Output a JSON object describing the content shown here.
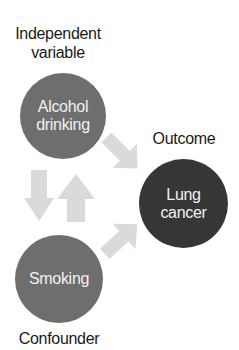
{
  "diagram": {
    "type": "causal-diagram",
    "labels": {
      "independent_line1": "Independent",
      "independent_line2": "variable",
      "outcome": "Outcome",
      "confounder": "Confounder"
    },
    "nodes": {
      "alcohol": {
        "line1": "Alcohol",
        "line2": "drinking",
        "color": "#6e6e6e"
      },
      "lung": {
        "line1": "Lung",
        "line2": "cancer",
        "color": "#363636"
      },
      "smoking": {
        "line1": "Smoking",
        "color": "#6e6e6e"
      }
    },
    "arrows": [
      {
        "from": "Alcohol drinking",
        "to": "Lung cancer",
        "direction": "down-right"
      },
      {
        "from": "Alcohol drinking",
        "to": "Smoking",
        "direction": "down"
      },
      {
        "from": "Smoking",
        "to": "Alcohol drinking",
        "direction": "up"
      },
      {
        "from": "Smoking",
        "to": "Lung cancer",
        "direction": "up-right"
      }
    ],
    "arrow_color": "#dadada"
  }
}
